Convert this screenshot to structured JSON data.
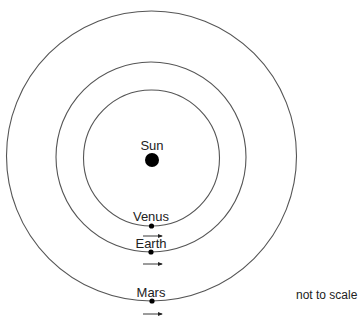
{
  "diagram": {
    "sun": {
      "label": "Sun",
      "cx": 152,
      "cy": 160,
      "r": 7
    },
    "orbits": [
      {
        "name": "Venus",
        "label": "Venus",
        "cx": 151.5,
        "cy": 158,
        "r": 68
      },
      {
        "name": "Earth",
        "label": "Earth",
        "cx": 151,
        "cy": 157,
        "r": 95
      },
      {
        "name": "Mars",
        "label": "Mars",
        "cx": 151.5,
        "cy": 156,
        "r": 145
      }
    ],
    "note": "not to scale",
    "colors": {
      "line": "#555555",
      "dot": "#000000",
      "text": "#222222"
    }
  }
}
